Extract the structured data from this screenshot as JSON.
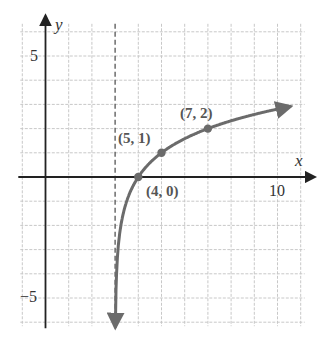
{
  "chart_data": {
    "type": "line",
    "title": "",
    "function_hint": "y = log2(x - 3)",
    "xlabel": "x",
    "ylabel": "y",
    "xlim": [
      -1,
      11
    ],
    "ylim": [
      -6,
      6
    ],
    "grid": true,
    "grid_step": 1,
    "x_tick_labels": [
      {
        "value": 10,
        "label": "10"
      }
    ],
    "y_tick_labels": [
      {
        "value": 5,
        "label": "5"
      },
      {
        "value": -5,
        "label": "−5"
      }
    ],
    "asymptote": {
      "type": "vertical",
      "x": 3,
      "style": "dashed"
    },
    "series": [
      {
        "name": "curve",
        "color": "#6b6b6b",
        "points": [
          [
            3.008,
            -7
          ],
          [
            3.05,
            -4.32
          ],
          [
            3.25,
            -2
          ],
          [
            3.5,
            -1
          ],
          [
            4,
            0
          ],
          [
            5,
            1
          ],
          [
            6,
            1.585
          ],
          [
            7,
            2
          ],
          [
            8,
            2.32
          ],
          [
            9,
            2.585
          ],
          [
            10,
            2.807
          ],
          [
            11,
            3
          ]
        ]
      }
    ],
    "labeled_points": [
      {
        "x": 4,
        "y": 0,
        "label": "(4, 0)"
      },
      {
        "x": 5,
        "y": 1,
        "label": "(5, 1)"
      },
      {
        "x": 7,
        "y": 2,
        "label": "(7, 2)"
      }
    ],
    "legend": null
  },
  "axes": {
    "x_label": "x",
    "y_label": "y",
    "tick_10": "10",
    "tick_5": "5",
    "tick_neg5": "−5"
  },
  "points": {
    "p1": "(4, 0)",
    "p2": "(5, 1)",
    "p3": "(7, 2)"
  },
  "colors": {
    "grid": "#c8c8c8",
    "axis": "#222222",
    "curve": "#6b6b6b",
    "asymptote": "#555555"
  }
}
